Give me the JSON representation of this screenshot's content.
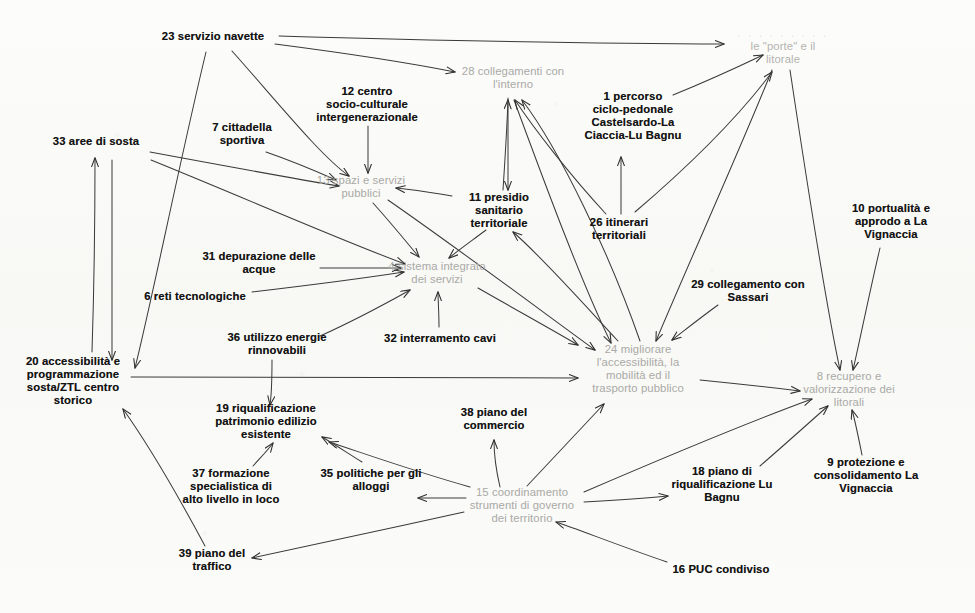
{
  "diagram": {
    "language": "it",
    "background_color": "#fbfbf9",
    "node_styles": {
      "driver_color": "#141414",
      "outcome_color": "#a9a9a6",
      "edge_color": "#3a3a3a"
    },
    "nodes": [
      {
        "id": "23",
        "label": "23 servizio navette",
        "x": 213,
        "y": 37,
        "style": "dark"
      },
      {
        "id": "28",
        "label": "28 collegamenti con\nl'interno",
        "x": 513,
        "y": 78,
        "style": "light"
      },
      {
        "id": "21",
        "label": "le \"porte\" e il\nlitorale",
        "x": 783,
        "y": 47,
        "style": "ghost",
        "faded_first_line": ". . . . . . . . .",
        "note": "prima riga illeggibile nella scansione"
      },
      {
        "id": "12",
        "label": "12 centro\nsocio-culturale\nintergenerazionale",
        "x": 367,
        "y": 105,
        "style": "dark"
      },
      {
        "id": "1",
        "label": "1 percorso\nciclo-pedonale\nCastelsardo-La\nCiaccia-Lu Bagnu",
        "x": 633,
        "y": 116,
        "style": "dark"
      },
      {
        "id": "7",
        "label": "7 cittadella\nsportiva",
        "x": 242,
        "y": 134,
        "style": "dark"
      },
      {
        "id": "33",
        "label": "33 aree di sosta",
        "x": 96,
        "y": 142,
        "style": "dark"
      },
      {
        "id": "13",
        "label": "13 spazi e servizi\npubblici",
        "x": 361,
        "y": 187,
        "style": "light"
      },
      {
        "id": "11",
        "label": "11 presidio\nsanitario\nterritoriale",
        "x": 499,
        "y": 211,
        "style": "dark"
      },
      {
        "id": "10",
        "label": "10 portualità e\napprodo a La\nVignaccia",
        "x": 891,
        "y": 222,
        "style": "dark"
      },
      {
        "id": "26",
        "label": "26 itinerari\nterritoriali",
        "x": 619,
        "y": 229,
        "style": "dark"
      },
      {
        "id": "31",
        "label": "31 depurazione delle\nacque",
        "x": 259,
        "y": 263,
        "style": "dark"
      },
      {
        "id": "4",
        "label": "4 sistema integrato\ndei servizi",
        "x": 437,
        "y": 273,
        "style": "light"
      },
      {
        "id": "29",
        "label": "29 collegamento con\nSassari",
        "x": 748,
        "y": 291,
        "style": "dark"
      },
      {
        "id": "6",
        "label": "6 reti tecnologiche",
        "x": 195,
        "y": 297,
        "style": "dark"
      },
      {
        "id": "36",
        "label": "36 utilizzo energie\nrinnovabili",
        "x": 277,
        "y": 344,
        "style": "dark"
      },
      {
        "id": "32",
        "label": "32 interramento cavi",
        "x": 440,
        "y": 339,
        "style": "dark"
      },
      {
        "id": "24",
        "label": "24 migliorare\nl'accessibilità, la\nmobilità ed il\ntrasporto pubblico",
        "x": 638,
        "y": 369,
        "style": "light"
      },
      {
        "id": "20",
        "label": "20 accessibilità e\nprogrammazione\nsosta/ZTL centro\nstorico",
        "x": 73,
        "y": 381,
        "style": "dark"
      },
      {
        "id": "8",
        "label": "8 recupero e\nvalorizzazione dei\nlitorali",
        "x": 849,
        "y": 390,
        "style": "light"
      },
      {
        "id": "38",
        "label": "38 piano del\ncommercio",
        "x": 494,
        "y": 419,
        "style": "dark"
      },
      {
        "id": "19",
        "label": "19 riqualificazione\npatrimonio edilizio\nesistente",
        "x": 266,
        "y": 422,
        "style": "dark"
      },
      {
        "id": "9",
        "label": "9 protezione e\nconsolidamento La\nVignaccia",
        "x": 866,
        "y": 476,
        "style": "dark"
      },
      {
        "id": "35",
        "label": "35 politiche per gli\nalloggi",
        "x": 371,
        "y": 480,
        "style": "dark"
      },
      {
        "id": "37",
        "label": "37 formazione\nspecialistica di\nalto livello in loco",
        "x": 231,
        "y": 487,
        "style": "dark"
      },
      {
        "id": "18",
        "label": "18 piano di\nriqualificazione Lu\nBagnu",
        "x": 722,
        "y": 485,
        "style": "dark"
      },
      {
        "id": "15",
        "label": "15 coordinamento\nstrumenti di governo\ndei territorio",
        "x": 522,
        "y": 506,
        "style": "light"
      },
      {
        "id": "39",
        "label": "39 piano del\ntraffico",
        "x": 212,
        "y": 560,
        "style": "dark"
      },
      {
        "id": "16",
        "label": "16 PUC condiviso",
        "x": 721,
        "y": 570,
        "style": "dark"
      }
    ],
    "edges": [
      {
        "from": "23",
        "to": "21",
        "path": "M 279,36 C 420,40 600,44 724,44"
      },
      {
        "from": "23",
        "to": "28",
        "path": "M 275,44 C 360,55 425,66 455,72"
      },
      {
        "from": "23",
        "to": "13",
        "path": "M 232,51 C 280,105 320,155 349,176"
      },
      {
        "from": "23",
        "to": "20",
        "path": "M 206,52 C 180,160 152,300 135,368"
      },
      {
        "from": "12",
        "to": "13",
        "path": "M 368,126 C 368,145 368,160 368,173"
      },
      {
        "from": "7",
        "to": "13",
        "path": "M 266,152 C 295,162 318,172 336,180"
      },
      {
        "from": "33",
        "to": "13",
        "path": "M 150,152 C 220,165 290,178 339,186"
      },
      {
        "from": "33",
        "to": "4",
        "path": "M 151,160 C 240,196 340,240 405,264"
      },
      {
        "from": "20",
        "to": "33",
        "path": "M 92,352 C 94,290 95,215 95,158"
      },
      {
        "from": "23x",
        "to": "20",
        "path": "M 112,160 C 112,250 112,330 112,360"
      },
      {
        "from": "11",
        "to": "13",
        "path": "M 452,196 C 430,192 412,190 396,188"
      },
      {
        "from": "11",
        "to": "4",
        "path": "M 486,230 C 470,242 456,252 449,258"
      },
      {
        "from": "11",
        "to": "28",
        "path": "M 503,190 C 505,160 507,125 508,100"
      },
      {
        "from": "31",
        "to": "4",
        "path": "M 320,268 C 355,268 382,268 401,268"
      },
      {
        "from": "6",
        "to": "4",
        "path": "M 252,292 C 320,284 378,276 404,272"
      },
      {
        "from": "36",
        "to": "4",
        "path": "M 320,336 C 360,318 392,300 410,290"
      },
      {
        "from": "32",
        "to": "4",
        "path": "M 439,327 C 439,312 438,300 438,292"
      },
      {
        "from": "13",
        "to": "4",
        "path": "M 373,203 C 392,224 408,244 419,257"
      },
      {
        "from": "13",
        "to": "24",
        "path": "M 388,200 C 460,250 540,310 595,350"
      },
      {
        "from": "4",
        "to": "24",
        "path": "M 478,288 C 520,312 556,332 578,345"
      },
      {
        "from": "28",
        "to": "11",
        "path": "M 508,98 C 508,140 508,170 508,190"
      },
      {
        "from": "28",
        "to": "24",
        "path": "M 514,100 C 540,170 580,280 611,343"
      },
      {
        "from": "26",
        "to": "28",
        "path": "M 606,214 C 570,175 535,130 515,100"
      },
      {
        "from": "26",
        "to": "1",
        "path": "M 621,214 C 621,195 621,175 621,157"
      },
      {
        "from": "26",
        "to": "21",
        "path": "M 635,212 C 690,165 740,115 772,72"
      },
      {
        "from": "1",
        "to": "21",
        "path": "M 673,95 C 705,82 740,66 763,55"
      },
      {
        "from": "24",
        "to": "28",
        "path": "M 640,341 C 610,255 560,150 522,100"
      },
      {
        "from": "24",
        "to": "11",
        "path": "M 618,341 C 580,300 540,255 513,232"
      },
      {
        "from": "24",
        "to": "8",
        "path": "M 700,380 C 740,384 775,388 800,391"
      },
      {
        "from": "21",
        "to": "8",
        "path": "M 790,70 C 805,170 825,300 840,370"
      },
      {
        "from": "21",
        "to": "24",
        "path": "M 772,70 C 740,150 690,260 656,341"
      },
      {
        "from": "29",
        "to": "24",
        "path": "M 718,305 C 700,318 685,330 672,340"
      },
      {
        "from": "10",
        "to": "8",
        "path": "M 880,248 C 870,290 860,340 853,370"
      },
      {
        "from": "9",
        "to": "8",
        "path": "M 862,455 C 858,435 855,420 852,410"
      },
      {
        "from": "18",
        "to": "8",
        "path": "M 760,466 C 790,440 812,420 828,406"
      },
      {
        "from": "15",
        "to": "8",
        "path": "M 584,492 C 670,455 760,418 812,399"
      },
      {
        "from": "15",
        "to": "18",
        "path": "M 584,502 C 620,500 648,498 668,496"
      },
      {
        "from": "15",
        "to": "38",
        "path": "M 500,487 C 496,470 494,455 494,440"
      },
      {
        "from": "15",
        "to": "24",
        "path": "M 527,486 C 556,455 584,425 604,404"
      },
      {
        "from": "15",
        "to": "35",
        "path": "M 466,498 C 446,498 430,498 418,498"
      },
      {
        "from": "15",
        "to": "19",
        "path": "M 470,487 C 410,470 360,452 329,442"
      },
      {
        "from": "15",
        "to": "39",
        "path": "M 464,512 C 390,528 300,548 252,558"
      },
      {
        "from": "16",
        "to": "15",
        "path": "M 667,562 C 620,546 580,530 556,522"
      },
      {
        "from": "35",
        "to": "19",
        "path": "M 362,462 C 346,452 334,444 322,437"
      },
      {
        "from": "37",
        "to": "19",
        "path": "M 253,466 C 262,456 268,450 273,443"
      },
      {
        "from": "36",
        "to": "19",
        "path": "M 272,360 C 272,385 271,398 270,405"
      },
      {
        "from": "20",
        "to": "24",
        "path": "M 131,377 C 300,378 470,378 578,378"
      },
      {
        "from": "39",
        "to": "20",
        "path": "M 205,546 C 175,490 145,440 123,409"
      }
    ]
  }
}
